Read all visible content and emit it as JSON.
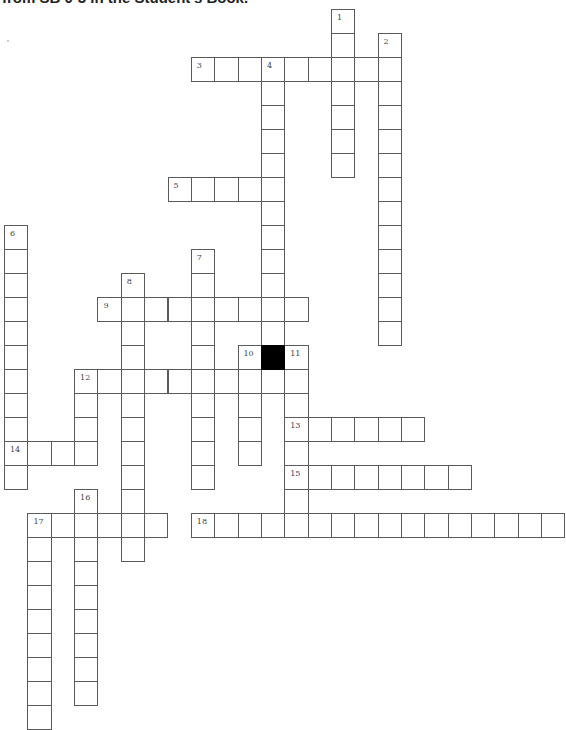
{
  "header": {
    "text": "from SB 0-3 in the Student's Book."
  },
  "grid": {
    "origin_x": 4,
    "origin_y": 9,
    "cell_width": 23.35,
    "cell_height": 24,
    "colors": {
      "border": "#5a5a5a",
      "cell": "#ffffff",
      "black": "#000000",
      "number": "#444444"
    }
  },
  "entries": [
    {
      "number": "1",
      "direction": "down",
      "row": 0,
      "col": 14,
      "length": 7
    },
    {
      "number": "2",
      "direction": "down",
      "row": 1,
      "col": 16,
      "length": 13
    },
    {
      "number": "3",
      "direction": "across",
      "row": 2,
      "col": 8,
      "length": 9
    },
    {
      "number": "4",
      "direction": "down",
      "row": 2,
      "col": 11,
      "length": 12
    },
    {
      "number": "5",
      "direction": "across",
      "row": 7,
      "col": 7,
      "length": 5
    },
    {
      "number": "6",
      "direction": "down",
      "row": 9,
      "col": 0,
      "length": 11
    },
    {
      "number": "7",
      "direction": "down",
      "row": 10,
      "col": 8,
      "length": 10
    },
    {
      "number": "8",
      "direction": "down",
      "row": 11,
      "col": 5,
      "length": 12
    },
    {
      "number": "9",
      "direction": "across",
      "row": 12,
      "col": 4,
      "length": 9
    },
    {
      "number": "10",
      "direction": "down",
      "row": 14,
      "col": 10,
      "length": 5
    },
    {
      "number": "11",
      "direction": "down",
      "row": 14,
      "col": 12,
      "length": 8
    },
    {
      "number": "12",
      "direction": "across",
      "row": 15,
      "col": 3,
      "length": 10
    },
    {
      "number": "12",
      "direction": "down",
      "row": 15,
      "col": 3,
      "length": 4
    },
    {
      "number": "13",
      "direction": "across",
      "row": 17,
      "col": 12,
      "length": 6
    },
    {
      "number": "14",
      "direction": "across",
      "row": 18,
      "col": 0,
      "length": 4
    },
    {
      "number": "15",
      "direction": "across",
      "row": 19,
      "col": 12,
      "length": 8
    },
    {
      "number": "16",
      "direction": "down",
      "row": 20,
      "col": 3,
      "length": 9
    },
    {
      "number": "17",
      "direction": "across",
      "row": 21,
      "col": 1,
      "length": 6
    },
    {
      "number": "17",
      "direction": "down",
      "row": 21,
      "col": 1,
      "length": 9
    },
    {
      "number": "18",
      "direction": "across",
      "row": 21,
      "col": 8,
      "length": 16
    }
  ],
  "black_cells": [
    {
      "row": 14,
      "col": 11
    }
  ]
}
